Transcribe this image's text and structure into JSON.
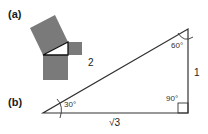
{
  "panel_a": {
    "label": "(a)",
    "description": "Pythagorean squares on sides of a right triangle",
    "square_color": "#7a7a7a"
  },
  "panel_b": {
    "label": "(b)",
    "sides": {
      "hypotenuse": "2",
      "opposite": "1",
      "adjacent": "√3"
    },
    "angles": {
      "left": "30°",
      "top": "60°",
      "right": "90°"
    }
  },
  "colors": {
    "line": "#333333",
    "square_fill": "#7a7a7a"
  }
}
